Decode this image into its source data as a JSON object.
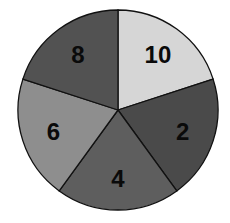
{
  "chart_data": {
    "type": "pie",
    "title": "",
    "start_angle_deg": 0,
    "direction": "clockwise",
    "slices": [
      {
        "label": "10",
        "value": 1,
        "color": "#d6d6d6"
      },
      {
        "label": "2",
        "value": 1,
        "color": "#4a4a4a"
      },
      {
        "label": "4",
        "value": 1,
        "color": "#5e5e5e"
      },
      {
        "label": "6",
        "value": 1,
        "color": "#8e8e8e"
      },
      {
        "label": "8",
        "value": 1,
        "color": "#525252"
      }
    ],
    "labels_shown": [
      "10",
      "2",
      "4",
      "6",
      "8"
    ],
    "legend": "none",
    "grid": false
  },
  "layout": {
    "cx": 118,
    "cy": 110,
    "r": 100,
    "stroke": "#111111"
  }
}
